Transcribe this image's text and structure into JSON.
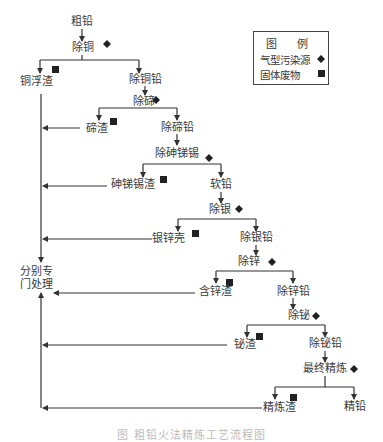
{
  "diagram": {
    "nodes": {
      "crude_lead": "粗铅",
      "decopper": "除铜",
      "copper_dross": "铜浮渣",
      "decopper_lead": "除铜铅",
      "detellurium": "除碲",
      "tellurium_slag": "碲渣",
      "detellurium_lead": "除碲铅",
      "de_as_sb_sn": "除砷锑锡",
      "as_sb_sn_slag": "砷锑锡渣",
      "soft_lead": "软铅",
      "desilver": "除银",
      "silver_zinc_crust": "银锌壳",
      "desilver_lead": "除银铅",
      "dezinc": "除锌",
      "zinc_slag": "含锌渣",
      "dezinc_lead": "除锌铅",
      "debismuth": "除铋",
      "bismuth_slag": "铋渣",
      "debismuth_lead": "除铋铅",
      "final_refining": "最终精炼",
      "refining_slag": "精炼渣",
      "refined_lead": "精铅",
      "separate_treatment_line1": "分别专",
      "separate_treatment_line2": "门处理"
    },
    "legend": {
      "title": "图 例",
      "gas_source": "气型污染源",
      "solid_waste": "固体废物",
      "gas_symbol": "diamond",
      "solid_symbol": "square"
    },
    "caption": "图 粗铅火法精炼工艺流程图",
    "colors": {
      "line": "#333333",
      "text": "#3a3a3a",
      "marker": "#222222"
    }
  }
}
